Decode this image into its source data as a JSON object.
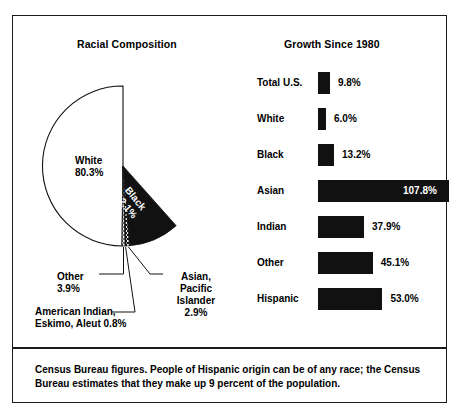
{
  "figure": {
    "pie_title": "Racial Composition",
    "bar_title": "Growth Since 1980",
    "footer_note": "Census Bureau figures. People of Hispanic origin can be of any race; the Census Bureau estimates that they make up 9 percent of the population."
  },
  "pie_labels": {
    "white": "White\n80.3%",
    "black": "Black\n12.1%",
    "other": "Other\n3.9%",
    "american_indian": "American Indian,\nEskimo, Aleut 0.8%",
    "asian": "Asian,\nPacific\nIslander\n2.9%"
  },
  "colors": {
    "ink": "#111111",
    "border": "#1a1a1a",
    "background": "#ffffff"
  },
  "chart_data": [
    {
      "type": "pie",
      "title": "Racial Composition",
      "categories": [
        "White",
        "Black",
        "Asian, Pacific Islander",
        "Other",
        "American Indian, Eskimo, Aleut"
      ],
      "values": [
        80.3,
        12.1,
        2.9,
        3.9,
        0.8
      ],
      "unit": "percent",
      "labels": [
        "White 80.3%",
        "Black 12.1%",
        "Asian, Pacific Islander 2.9%",
        "Other 3.9%",
        "American Indian, Eskimo, Aleut 0.8%"
      ],
      "slice_fills": [
        "white",
        "black",
        "dotted-dark",
        "dotted-light",
        "black-thin"
      ],
      "legend": "none",
      "notes": "Slices labeled by callout lines beneath the pie"
    },
    {
      "type": "bar",
      "orientation": "horizontal",
      "title": "Growth Since 1980",
      "categories": [
        "Total U.S.",
        "White",
        "Black",
        "Asian",
        "Indian",
        "Other",
        "Hispanic"
      ],
      "values": [
        9.8,
        6.0,
        13.2,
        107.8,
        37.9,
        45.1,
        53.0
      ],
      "value_labels": [
        "9.8%",
        "6.0%",
        "13.2%",
        "107.8%",
        "37.9%",
        "45.1%",
        "53.0%"
      ],
      "unit": "percent",
      "xlabel": "",
      "ylabel": "",
      "xlim": [
        0,
        107.8
      ],
      "grid": false,
      "legend": "none"
    }
  ],
  "bars": [
    {
      "category": "Total U.S.",
      "value_label": "9.8%",
      "value": 9.8,
      "inside": false
    },
    {
      "category": "White",
      "value_label": "6.0%",
      "value": 6.0,
      "inside": false
    },
    {
      "category": "Black",
      "value_label": "13.2%",
      "value": 13.2,
      "inside": false
    },
    {
      "category": "Asian",
      "value_label": "107.8%",
      "value": 107.8,
      "inside": true
    },
    {
      "category": "Indian",
      "value_label": "37.9%",
      "value": 37.9,
      "inside": false
    },
    {
      "category": "Other",
      "value_label": "45.1%",
      "value": 45.1,
      "inside": false
    },
    {
      "category": "Hispanic",
      "value_label": "53.0%",
      "value": 53.0,
      "inside": false
    }
  ]
}
